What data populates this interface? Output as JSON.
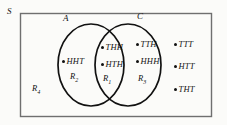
{
  "figure": {
    "universe_label": "S",
    "sets": [
      {
        "id": "A",
        "label": "A"
      },
      {
        "id": "C",
        "label": "C"
      }
    ],
    "regions": [
      {
        "id": "R1",
        "label": "R",
        "subscript": "1",
        "description": "intersection-of-A-and-C"
      },
      {
        "id": "R2",
        "label": "R",
        "subscript": "2",
        "description": "A-only"
      },
      {
        "id": "R3",
        "label": "R",
        "subscript": "3",
        "description": "C-only"
      },
      {
        "id": "R4",
        "label": "R",
        "subscript": "4",
        "description": "outside-A-and-C"
      }
    ],
    "outcomes": {
      "a_only": [
        {
          "label": "HHT"
        }
      ],
      "intersection": [
        {
          "label": "THH"
        },
        {
          "label": "HTH"
        }
      ],
      "c_only": [
        {
          "label": "TTH"
        },
        {
          "label": "HHH"
        }
      ],
      "outside": [
        {
          "label": "TTT"
        },
        {
          "label": "HTT"
        },
        {
          "label": "THT"
        }
      ]
    },
    "colors": {
      "background": "#fbfbf9",
      "stroke": "#111111",
      "border": "#6f6f6f",
      "text": "#111111"
    }
  }
}
